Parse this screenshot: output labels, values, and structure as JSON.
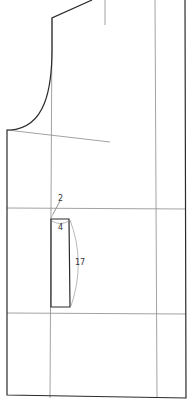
{
  "diagram": {
    "type": "pattern-draft",
    "colors": {
      "outline": "#2b2b2b",
      "guide": "#8a8a8a",
      "label": "#333333",
      "background": "#ffffff"
    },
    "labels": {
      "pocket_offset": "2",
      "pocket_width": "4",
      "pocket_length": "17"
    }
  }
}
